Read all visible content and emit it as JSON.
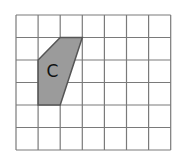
{
  "diagram": {
    "type": "grid-shape",
    "grid": {
      "columns": 7,
      "rows": 6,
      "origin_px": [
        16,
        15
      ],
      "cell_width_px": 22.1,
      "cell_height_px": 22.5,
      "line_color": "#7a7a7a"
    },
    "shape": {
      "label": "C",
      "fill_color": "#9b9b9b",
      "stroke_color": "#555555",
      "vertices_grid": [
        [
          2,
          1
        ],
        [
          3,
          1
        ],
        [
          2,
          4
        ],
        [
          1,
          4
        ],
        [
          1,
          2
        ]
      ],
      "label_position_grid": [
        1.65,
        2.55
      ]
    }
  }
}
